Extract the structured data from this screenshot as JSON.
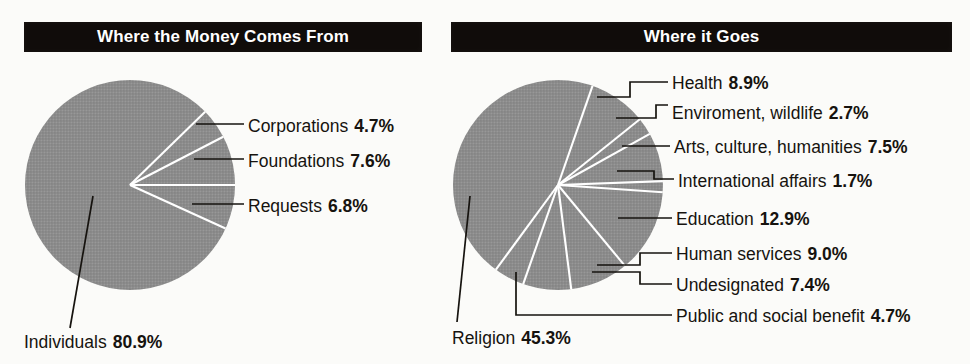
{
  "page": {
    "background_color": "#fbfbf9",
    "text_color": "#16130f",
    "header_bg_color": "#100c0a",
    "header_text_color": "#ffffff",
    "pie_fill_color": "#8d8d8d",
    "pie_separator_color": "#ffffff",
    "leader_line_color": "#16130f"
  },
  "charts": [
    {
      "id": "money-comes-from",
      "title": "Where the Money Comes From",
      "chart_data": {
        "type": "pie",
        "title": "Where the Money Comes From",
        "units": "percent",
        "labels": [
          "Individuals",
          "Requests",
          "Foundations",
          "Corporations"
        ],
        "values": [
          80.9,
          6.8,
          7.6,
          4.7
        ],
        "legend": "leader-line callouts",
        "grid": false
      },
      "slices": [
        {
          "name": "Individuals",
          "pct": "80.9%",
          "value": 80.9
        },
        {
          "name": "Requests",
          "pct": "6.8%",
          "value": 6.8
        },
        {
          "name": "Foundations",
          "pct": "7.6%",
          "value": 7.6
        },
        {
          "name": "Corporations",
          "pct": "4.7%",
          "value": 4.7
        }
      ]
    },
    {
      "id": "where-it-goes",
      "title": "Where it Goes",
      "chart_data": {
        "type": "pie",
        "title": "Where it Goes",
        "units": "percent",
        "labels": [
          "Religion",
          "Education",
          "Human services",
          "Health",
          "Arts, culture, humanities",
          "Undesignated",
          "Public and social benefit",
          "Enviroment, wildlife",
          "International affairs"
        ],
        "values": [
          45.3,
          12.9,
          9.0,
          8.9,
          7.5,
          7.4,
          4.7,
          2.7,
          1.7
        ],
        "legend": "leader-line callouts",
        "grid": false
      },
      "slices": [
        {
          "name": "Health",
          "pct": "8.9%",
          "value": 8.9
        },
        {
          "name": "Enviroment, wildlife",
          "pct": "2.7%",
          "value": 2.7
        },
        {
          "name": "Arts, culture, humanities",
          "pct": "7.5%",
          "value": 7.5
        },
        {
          "name": "International affairs",
          "pct": "1.7%",
          "value": 1.7
        },
        {
          "name": "Education",
          "pct": "12.9%",
          "value": 12.9
        },
        {
          "name": "Human services",
          "pct": "9.0%",
          "value": 9.0
        },
        {
          "name": "Undesignated",
          "pct": "7.4%",
          "value": 7.4
        },
        {
          "name": "Public and social benefit",
          "pct": "4.7%",
          "value": 4.7
        },
        {
          "name": "Religion",
          "pct": "45.3%",
          "value": 45.3
        }
      ]
    }
  ]
}
